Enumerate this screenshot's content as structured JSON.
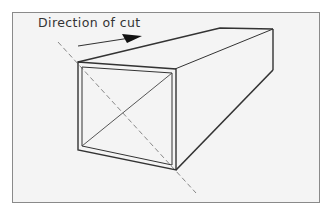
{
  "diagram": {
    "label": "Direction of cut",
    "colors": {
      "background": "#f4f4f4",
      "frame": "#8a8a8a",
      "lines": "#333333",
      "dashed": "#888888"
    },
    "elements": [
      "rectangular-tube-perspective",
      "cut-direction-arrow",
      "diagonal-cut-line",
      "inner-diagonal"
    ]
  }
}
